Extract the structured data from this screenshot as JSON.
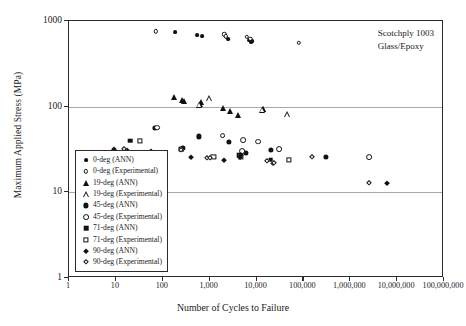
{
  "chart_data": {
    "type": "scatter",
    "title": "",
    "annotation": [
      "Scotchply 1003",
      "Glass/Epoxy"
    ],
    "xlabel": "Number of Cycles to Failure",
    "ylabel": "Maximum Applied Stress (MPa)",
    "xscale": "log",
    "yscale": "log",
    "xlim": [
      1,
      100000000
    ],
    "ylim": [
      1,
      1000
    ],
    "xticks": [
      1,
      10,
      100,
      1000,
      10000,
      100000,
      1000000,
      10000000,
      100000000
    ],
    "xticklabels": [
      "1",
      "10",
      "100",
      "1,000",
      "10,000",
      "100,000",
      "1,000,000",
      "10,000,000",
      "100,000,000"
    ],
    "yticks": [
      1,
      10,
      100,
      1000
    ],
    "yticklabels": [
      "1",
      "10",
      "100",
      "1000"
    ],
    "grid": "horizontal-major",
    "gridlines_y": [
      10,
      100
    ],
    "legend_position": "lower-left-inside",
    "series": [
      {
        "name": "0-deg (ANN)",
        "marker": "circle-filled",
        "points": [
          [
            180,
            745
          ],
          [
            550,
            680
          ],
          [
            700,
            660
          ],
          [
            2300,
            640
          ],
          [
            2500,
            620
          ],
          [
            7000,
            600
          ],
          [
            7600,
            570
          ],
          [
            8000,
            585
          ]
        ]
      },
      {
        "name": "0-deg (Experimental)",
        "marker": "circle-open",
        "points": [
          [
            72,
            755
          ],
          [
            2050,
            700
          ],
          [
            2200,
            660
          ],
          [
            6200,
            650
          ],
          [
            7400,
            620
          ],
          [
            80000,
            555
          ]
        ]
      },
      {
        "name": "19-deg (ANN)",
        "marker": "triangle-filled",
        "points": [
          [
            175,
            128
          ],
          [
            260,
            120
          ],
          [
            285,
            118
          ],
          [
            620,
            108
          ],
          [
            660,
            112
          ],
          [
            1900,
            96
          ],
          [
            2700,
            88
          ],
          [
            4100,
            80
          ],
          [
            13000,
            92
          ],
          [
            14000,
            95
          ]
        ]
      },
      {
        "name": "19-deg (Experimental)",
        "marker": "triangle-open",
        "points": [
          [
            600,
            105
          ],
          [
            980,
            125
          ],
          [
            13500,
            93
          ],
          [
            45000,
            82
          ]
        ]
      },
      {
        "name": "45-deg (ANN)",
        "marker": "circle-filled-lg",
        "points": [
          [
            68,
            56
          ],
          [
            600,
            45
          ],
          [
            2600,
            39
          ],
          [
            250,
            32
          ],
          [
            270,
            33
          ],
          [
            20000,
            31
          ],
          [
            6000,
            29
          ],
          [
            300000,
            26
          ]
        ]
      },
      {
        "name": "45-deg (Experimental)",
        "marker": "circle-open-lg",
        "points": [
          [
            75,
            57
          ],
          [
            1900,
            46
          ],
          [
            5200,
            41
          ],
          [
            11000,
            39
          ],
          [
            30000,
            32
          ],
          [
            5000,
            30
          ],
          [
            2500000,
            26
          ]
        ]
      },
      {
        "name": "71-deg (ANN)",
        "marker": "square-filled",
        "points": [
          [
            20,
            40
          ],
          [
            250,
            32
          ],
          [
            4300,
            27
          ],
          [
            20000,
            24
          ]
        ]
      },
      {
        "name": "71-deg (Experimental)",
        "marker": "square-open",
        "points": [
          [
            33,
            40
          ],
          [
            1200,
            26
          ],
          [
            4700,
            26
          ],
          [
            50000,
            24
          ]
        ]
      },
      {
        "name": "90-deg (ANN)",
        "marker": "diamond-filled",
        "points": [
          [
            9,
            32
          ],
          [
            17,
            31
          ],
          [
            55,
            30
          ],
          [
            400,
            26
          ],
          [
            2000,
            24
          ],
          [
            4500,
            26
          ],
          [
            4700,
            27
          ],
          [
            22000,
            22
          ],
          [
            6000000,
            13
          ]
        ]
      },
      {
        "name": "90-deg (Experimental)",
        "marker": "diamond-open",
        "points": [
          [
            15,
            32
          ],
          [
            240,
            31
          ],
          [
            900,
            25
          ],
          [
            1000,
            25
          ],
          [
            17000,
            23
          ],
          [
            24000,
            22
          ],
          [
            150000,
            26
          ],
          [
            2500000,
            13
          ]
        ]
      }
    ]
  },
  "legend": {
    "items": [
      {
        "label": "0-deg (ANN)",
        "marker": "circle-filled"
      },
      {
        "label": "0-deg (Experimental)",
        "marker": "circle-open"
      },
      {
        "label": "19-deg (ANN)",
        "marker": "triangle-filled"
      },
      {
        "label": "19-deg (Experimental)",
        "marker": "triangle-open"
      },
      {
        "label": "45-deg (ANN)",
        "marker": "circle-filled-lg"
      },
      {
        "label": "45-deg (Experimental)",
        "marker": "circle-open-lg"
      },
      {
        "label": "71-deg (ANN)",
        "marker": "square-filled"
      },
      {
        "label": "71-deg (Experimental)",
        "marker": "square-open"
      },
      {
        "label": "90-deg (ANN)",
        "marker": "diamond-filled"
      },
      {
        "label": "90-deg (Experimental)",
        "marker": "diamond-open"
      }
    ]
  },
  "colors": {
    "ink": "#111111",
    "frame": "#2b2b2b",
    "grid": "#a8a8a8"
  }
}
